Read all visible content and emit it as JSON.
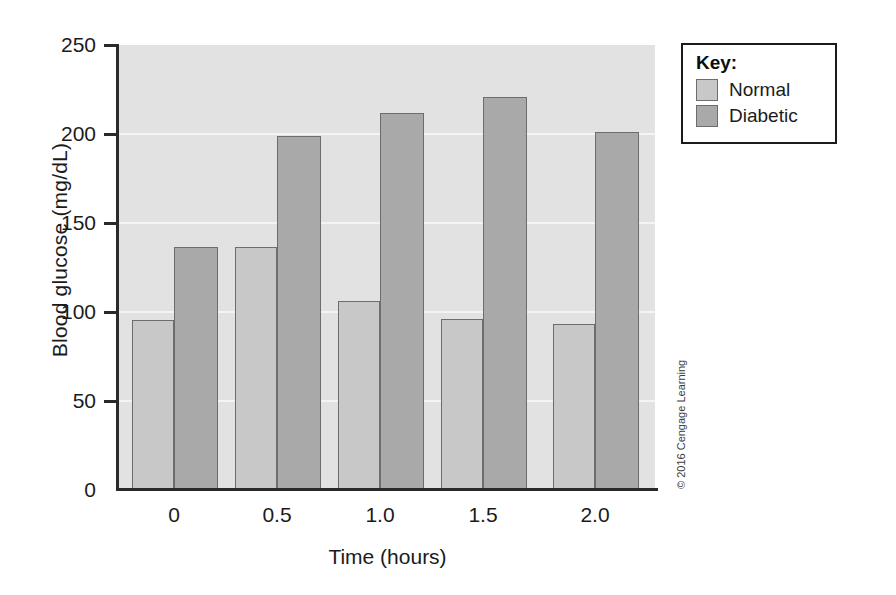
{
  "chart_data": {
    "type": "bar",
    "title": "",
    "xlabel": "Time (hours)",
    "ylabel": "Blood glucose (mg/dL)",
    "categories": [
      "0",
      "0.5",
      "1.0",
      "1.5",
      "2.0"
    ],
    "series": [
      {
        "name": "Normal",
        "values": [
          95,
          136,
          106,
          96,
          93
        ],
        "color": "#c8c8c8"
      },
      {
        "name": "Diabetic",
        "values": [
          136,
          199,
          212,
          221,
          201
        ],
        "color": "#a9a9a9"
      }
    ],
    "ylim": [
      0,
      250
    ],
    "yticks": [
      0,
      50,
      100,
      150,
      200,
      250
    ],
    "ytick_labels": [
      "0",
      "50",
      "100",
      "150",
      "200",
      "250"
    ],
    "xtick_labels": [
      "0",
      "0.5",
      "1.0",
      "1.5",
      "2.0"
    ],
    "grid": true,
    "grid_axis": "y",
    "legend_position": "top-right",
    "legend_title": "Key:",
    "plot_background": "#e2e2e2",
    "figure_background": "#ffffff"
  },
  "legend": {
    "title": "Key:",
    "entries": [
      {
        "label": "Normal",
        "color": "#c8c8c8"
      },
      {
        "label": "Diabetic",
        "color": "#a9a9a9"
      }
    ]
  },
  "axes": {
    "y_title": "Blood glucose (mg/dL)",
    "x_title": "Time (hours)",
    "y_ticks": [
      "250",
      "200",
      "150",
      "100",
      "50",
      "0"
    ],
    "x_ticks": [
      "0",
      "0.5",
      "1.0",
      "1.5",
      "2.0"
    ]
  },
  "credit": "© 2016 Cengage Learning"
}
